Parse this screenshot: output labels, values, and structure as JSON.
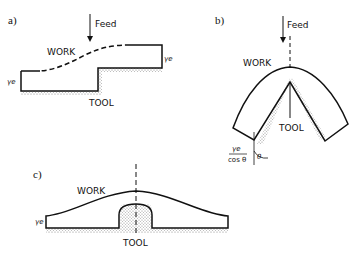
{
  "figure": {
    "panels": [
      {
        "id": "a",
        "label": "a)",
        "feed_label": "Feed",
        "work_label": "WORK",
        "tool_label": "TOOL",
        "thickness_left": "γe",
        "thickness_right": "γe"
      },
      {
        "id": "b",
        "label": "b)",
        "feed_label": "Feed",
        "work_label": "WORK",
        "tool_label": "TOOL",
        "thickness_numerator": "γe",
        "thickness_denominator": "cos θ",
        "angle_label": "θ"
      },
      {
        "id": "c",
        "label": "c)",
        "work_label": "WORK",
        "tool_label": "TOOL",
        "thickness_left": "γe"
      }
    ]
  }
}
